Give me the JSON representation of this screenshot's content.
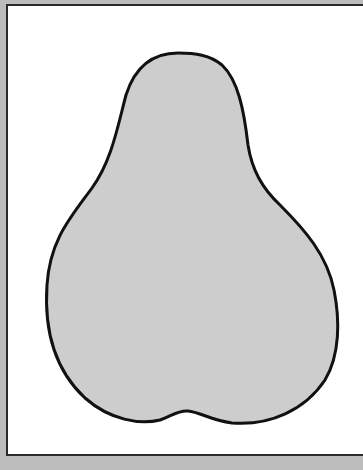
{
  "figure": {
    "kind": "pear-silhouette-outline",
    "colors": {
      "background": "#bcbcbc",
      "frame_fill": "#ffffff",
      "frame_border": "#2a2a2a",
      "shape_fill": "#cdcdcd",
      "shape_stroke": "#111111"
    },
    "shape_path": "M178,53 C150,53 134,70 126,95 C118,125 112,160 92,188 C70,218 50,240 47,285 C44,330 55,370 85,398 C110,420 140,425 160,420 C172,416 178,410 188,411 C200,412 210,420 232,423 C270,426 305,410 325,380 C340,355 340,320 334,290 C327,255 305,230 280,205 C262,188 252,170 248,145 C244,110 238,80 222,65 C210,55 195,53 178,53 Z",
    "stroke_width": 3
  }
}
